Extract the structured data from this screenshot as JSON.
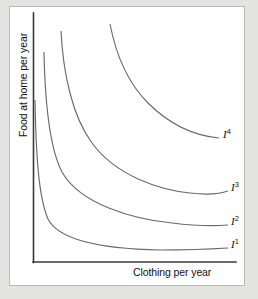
{
  "figure": {
    "background_color": "#e3e3e1",
    "panel_color": "#ffffff",
    "panel_border_color": "#b9b9b7",
    "axis_color": "#3a3a3a",
    "curve_color": "#6b6b6b"
  },
  "chart_data": {
    "type": "line",
    "title": "",
    "xlabel": "Clothing per year",
    "ylabel": "Food at home per year",
    "grid": false,
    "legend_position": "inline-right-of-curve",
    "axis_ticks": [],
    "xlim": [
      0,
      10
    ],
    "ylim": [
      0,
      10
    ],
    "annotations": [
      {
        "text": "I",
        "superscript": "1",
        "x": 231,
        "y": 243
      },
      {
        "text": "I",
        "superscript": "2",
        "x": 231,
        "y": 220
      },
      {
        "text": "I",
        "superscript": "3",
        "x": 231,
        "y": 186
      },
      {
        "text": "I",
        "superscript": "4",
        "x": 223,
        "y": 133
      }
    ],
    "series": [
      {
        "name": "I1",
        "label_base": "I",
        "label_superscript": "1",
        "path": "M 35,100 C 36,150 38,196 48,219 C 60,243 110,249 160,250 C 190,250 212,249 228,248",
        "end_point": [
          228,
          248
        ]
      },
      {
        "name": "I2",
        "label_base": "I",
        "label_superscript": "2",
        "path": "M 44,52 C 45,102 49,147 62,172 C 80,204 132,219 172,223 C 196,226 216,226 228,225",
        "end_point": [
          228,
          225
        ]
      },
      {
        "name": "I3",
        "label_base": "I",
        "label_superscript": "3",
        "path": "M 61,31 C 63,72 72,116 92,143 C 116,176 160,190 190,193 C 207,195 220,194 228,191",
        "end_point": [
          228,
          191
        ]
      },
      {
        "name": "I4",
        "label_base": "I",
        "label_superscript": "4",
        "path": "M 110,24 C 116,55 129,84 148,103 C 172,127 198,136 219,138",
        "end_point": [
          219,
          138
        ]
      }
    ],
    "axes": {
      "y_axis": {
        "x": 33,
        "y_top": 13,
        "y_bottom": 262
      },
      "x_axis": {
        "y": 262,
        "x_left": 33,
        "x_right": 236
      }
    }
  }
}
